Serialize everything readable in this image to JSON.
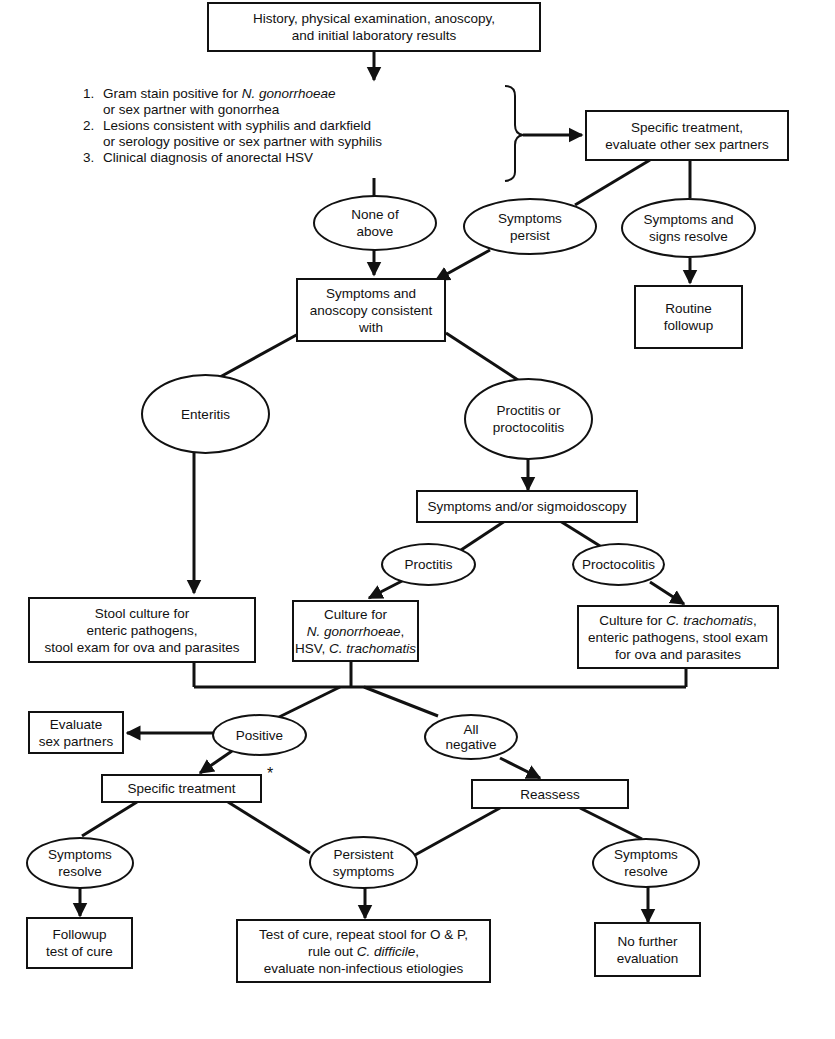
{
  "diagram": {
    "colors": {
      "stroke": "#111111",
      "background": "#ffffff"
    },
    "start": {
      "line1": "History, physical examination, anoscopy,",
      "line2": "and initial laboratory results"
    },
    "criteria": [
      {
        "num": "1.",
        "line1_pre": "Gram stain positive for ",
        "line1_italic": "N. gonorrhoeae",
        "line2": "or sex partner with gonorrhea"
      },
      {
        "num": "2.",
        "line1": "Lesions consistent with syphilis and darkfield",
        "line2": "or serology positive or sex partner with syphilis"
      },
      {
        "num": "3.",
        "line1": "Clinical diagnosis of anorectal HSV"
      }
    ],
    "specific_treatment_top": {
      "line1": "Specific treatment,",
      "line2": "evaluate other sex partners"
    },
    "none_of_above": {
      "line1": "None of",
      "line2": "above"
    },
    "symptoms_persist": {
      "line1": "Symptoms",
      "line2": "persist"
    },
    "symptoms_signs_resolve": {
      "line1": "Symptoms and",
      "line2": "signs resolve"
    },
    "routine_followup": {
      "line1": "Routine",
      "line2": "followup"
    },
    "symptoms_anoscopy": {
      "line1": "Symptoms and",
      "line2": "anoscopy consistent",
      "line3": "with"
    },
    "enteritis": {
      "label": "Enteritis"
    },
    "proctitis_or_proctocolitis": {
      "line1": "Proctitis or",
      "line2": "proctocolitis"
    },
    "sigmoidoscopy": {
      "label": "Symptoms and/or sigmoidoscopy"
    },
    "proctitis": {
      "label": "Proctitis"
    },
    "proctocolitis": {
      "label": "Proctocolitis"
    },
    "stool_culture": {
      "line1": "Stool culture for",
      "line2": "enteric pathogens,",
      "line3": "stool exam for ova and parasites"
    },
    "culture_proctitis": {
      "line1": "Culture for",
      "line2_italic": "N. gonorrhoeae",
      "line2_post": ",",
      "line3_pre": "HSV, ",
      "line3_italic": "C. trachomatis"
    },
    "culture_proctocolitis": {
      "line1_pre": "Culture for ",
      "line1_italic": "C. trachomatis",
      "line1_post": ",",
      "line2": "enteric pathogens, stool exam",
      "line3": "for ova and parasites"
    },
    "evaluate_partners": {
      "line1": "Evaluate",
      "line2": "sex partners"
    },
    "positive": {
      "label": "Positive"
    },
    "all_negative": {
      "line1": "All",
      "line2": "negative"
    },
    "specific_treatment": {
      "label": "Specific treatment",
      "footnote": "*"
    },
    "reassess": {
      "label": "Reassess"
    },
    "symptoms_resolve_left": {
      "line1": "Symptoms",
      "line2": "resolve"
    },
    "persistent_symptoms": {
      "line1": "Persistent",
      "line2": "symptoms"
    },
    "symptoms_resolve_right": {
      "line1": "Symptoms",
      "line2": "resolve"
    },
    "followup_test": {
      "line1": "Followup",
      "line2": "test of cure"
    },
    "test_of_cure": {
      "line1": "Test of cure, repeat stool for O & P,",
      "line2_pre": "rule out ",
      "line2_italic": "C. difficile",
      "line2_post": ",",
      "line3": "evaluate non-infectious etiologies"
    },
    "no_further": {
      "line1": "No further",
      "line2": "evaluation"
    }
  }
}
